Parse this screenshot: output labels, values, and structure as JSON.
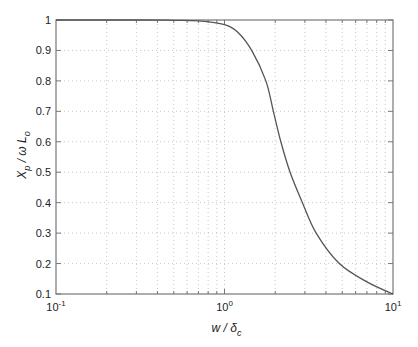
{
  "chart_data": {
    "type": "line",
    "title": "",
    "xlabel": "w / δc",
    "ylabel": "Xp / ω Lo",
    "xscale": "log",
    "xlim": [
      0.1,
      10
    ],
    "ylim": [
      0.1,
      1
    ],
    "grid": true,
    "x_tick_labels": [
      "10^-1",
      "10^0",
      "10^1"
    ],
    "y_tick_labels": [
      "0.1",
      "0.2",
      "0.3",
      "0.4",
      "0.5",
      "0.6",
      "0.7",
      "0.8",
      "0.9",
      "1"
    ],
    "series": [
      {
        "name": "Xp/ωLo",
        "color": "#555555",
        "x": [
          0.1,
          0.3,
          0.5,
          0.7,
          1.0,
          1.2,
          1.45,
          1.76,
          1.95,
          2.16,
          2.45,
          2.9,
          3.5,
          4.8,
          7.0,
          10.0
        ],
        "y": [
          1.0,
          1.0,
          0.999,
          0.997,
          0.985,
          0.96,
          0.9,
          0.8,
          0.7,
          0.6,
          0.5,
          0.4,
          0.3,
          0.2,
          0.14,
          0.1
        ]
      }
    ]
  },
  "axes": {
    "xlabel_main": "w / δ",
    "xlabel_sub": "c",
    "ylabel_main_x": "X",
    "ylabel_sub_p": "p",
    "ylabel_mid": " / ω L",
    "ylabel_sub_o": "o"
  }
}
